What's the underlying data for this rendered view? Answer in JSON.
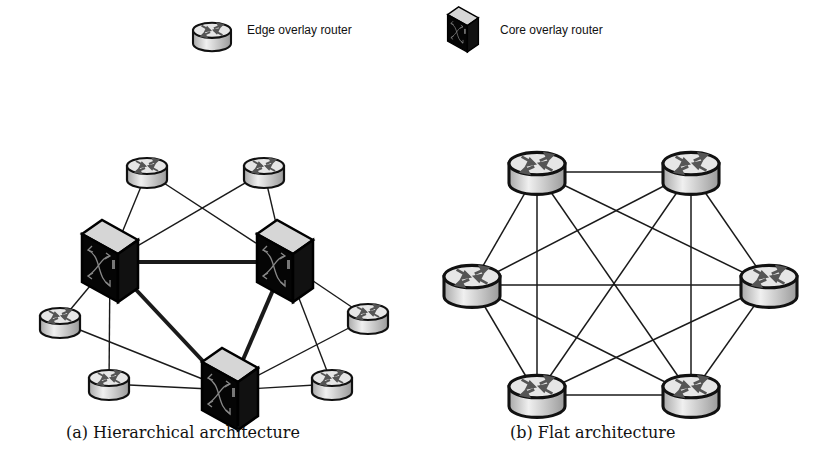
{
  "legend": {
    "edge_label": "Edge overlay router",
    "core_label": "Core overlay router"
  },
  "captions": {
    "a": "(a) Hierarchical architecture",
    "b": "(b) Flat architecture"
  },
  "colors": {
    "line": "#1a1a1a",
    "core_body": "#0a0a0a",
    "core_top": "#d9d9d9",
    "router_top": "#e8e8e8",
    "router_side": "#cfcfcf",
    "arrow": "#555555"
  },
  "hierarchical": {
    "core_nodes": [
      {
        "id": "c1",
        "x": 110,
        "y": 262
      },
      {
        "id": "c2",
        "x": 285,
        "y": 262
      },
      {
        "id": "c3",
        "x": 230,
        "y": 390
      }
    ],
    "edge_nodes": [
      {
        "id": "e1",
        "x": 147,
        "y": 172
      },
      {
        "id": "e2",
        "x": 264,
        "y": 172
      },
      {
        "id": "e3",
        "x": 60,
        "y": 322
      },
      {
        "id": "e4",
        "x": 368,
        "y": 318
      },
      {
        "id": "e5",
        "x": 109,
        "y": 384
      },
      {
        "id": "e6",
        "x": 332,
        "y": 384
      }
    ],
    "core_links": [
      [
        "c1",
        "c2"
      ],
      [
        "c1",
        "c3"
      ],
      [
        "c2",
        "c3"
      ]
    ],
    "edge_links": [
      [
        "e1",
        "c1"
      ],
      [
        "e1",
        "c2"
      ],
      [
        "e2",
        "c1"
      ],
      [
        "e2",
        "c2"
      ],
      [
        "e3",
        "c1"
      ],
      [
        "e3",
        "c3"
      ],
      [
        "e5",
        "c1"
      ],
      [
        "e5",
        "c3"
      ],
      [
        "e4",
        "c2"
      ],
      [
        "e4",
        "c3"
      ],
      [
        "e6",
        "c2"
      ],
      [
        "e6",
        "c3"
      ]
    ]
  },
  "flat": {
    "nodes": [
      {
        "id": "f1",
        "x": 537,
        "y": 172
      },
      {
        "id": "f2",
        "x": 691,
        "y": 172
      },
      {
        "id": "f3",
        "x": 472,
        "y": 285
      },
      {
        "id": "f4",
        "x": 769,
        "y": 285
      },
      {
        "id": "f5",
        "x": 537,
        "y": 395
      },
      {
        "id": "f6",
        "x": 691,
        "y": 395
      }
    ],
    "full_mesh": true
  }
}
